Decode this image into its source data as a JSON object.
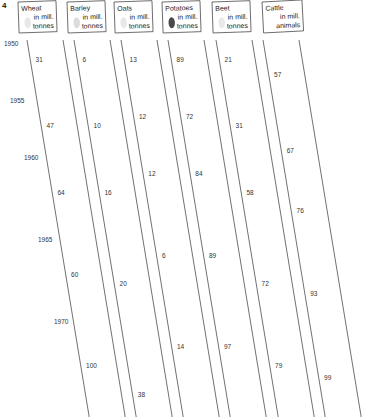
{
  "figure_number": "4",
  "colors": {
    "grain_sack": "#f2f2f2",
    "grain_sack_shade": "#d9d9d9",
    "barley_sack": "#dcdcdc",
    "potato_sack": "#4a4a4a",
    "cattle": "#6b6b6b",
    "outline": "#333333"
  },
  "chart_data": {
    "type": "pictograph",
    "title": "",
    "units_note": "one symbol per unit; partial symbols for fractions",
    "years": [
      "1950",
      "1955",
      "1960",
      "1965",
      "1970"
    ],
    "series": [
      {
        "name": "Wheat",
        "unit_line1": "in mill.",
        "unit_line2": "tonnes",
        "icon": "sack-light",
        "values": [
          31,
          47,
          64,
          60,
          100
        ]
      },
      {
        "name": "Barley",
        "unit_line1": "in mill.",
        "unit_line2": "tonnes",
        "icon": "sack-grey",
        "values": [
          6,
          10,
          16,
          20,
          38
        ]
      },
      {
        "name": "Oats",
        "unit_line1": "in mill.",
        "unit_line2": "tonnes",
        "icon": "sack-light",
        "values": [
          13,
          12,
          12,
          6,
          14
        ]
      },
      {
        "name": "Potatoes",
        "unit_line1": "in mill.",
        "unit_line2": "tonnes",
        "icon": "sack-dark",
        "values": [
          89,
          72,
          84,
          89,
          97
        ]
      },
      {
        "name": "Beet",
        "unit_line1": "in mill.",
        "unit_line2": "tonnes",
        "icon": "sack-light",
        "values": [
          21,
          31,
          58,
          72,
          79
        ]
      },
      {
        "name": "Cattle",
        "unit_line1": "in mill.",
        "unit_line2": "animals",
        "icon": "cow",
        "values": [
          57,
          67,
          76,
          93,
          99
        ]
      }
    ],
    "symbol_counts": [
      [
        5,
        8.5,
        11,
        10.3,
        17.6
      ],
      [
        5,
        8.3,
        13.3,
        16.7,
        31.6
      ],
      [
        5,
        4.6,
        4.6,
        2.3,
        5.4
      ],
      [
        5,
        4,
        4.7,
        5,
        5.4
      ],
      [
        5,
        7.4,
        13.8,
        17.1,
        18.8
      ],
      [
        1,
        1.2,
        1.3,
        1.6,
        1.7
      ]
    ]
  }
}
